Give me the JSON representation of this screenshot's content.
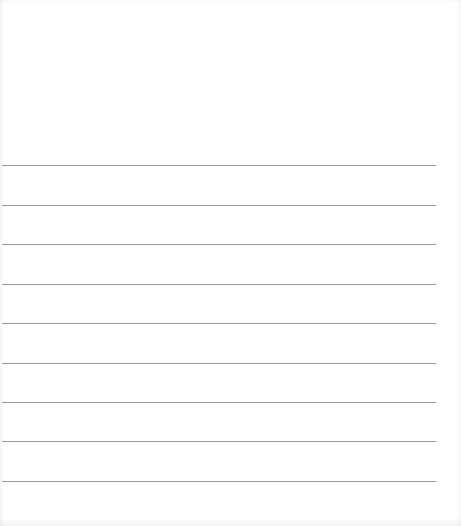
{
  "page": {
    "type": "lined-paper",
    "background_color": "#ffffff",
    "rule_color": "#9a9a9a",
    "rule_left": 2,
    "rule_width": 434,
    "rules": [
      {
        "y": 165
      },
      {
        "y": 205
      },
      {
        "y": 244
      },
      {
        "y": 284
      },
      {
        "y": 323
      },
      {
        "y": 363
      },
      {
        "y": 402
      },
      {
        "y": 441
      },
      {
        "y": 481
      }
    ]
  }
}
